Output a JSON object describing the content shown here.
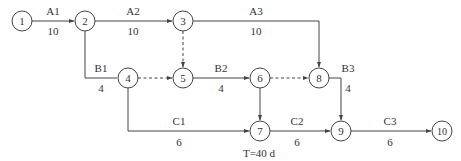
{
  "diagram": {
    "type": "activity-on-arrow network diagram",
    "nodes": [
      {
        "id": "1",
        "label": "1",
        "x": 22,
        "y": 21
      },
      {
        "id": "2",
        "label": "2",
        "x": 85,
        "y": 21
      },
      {
        "id": "3",
        "label": "3",
        "x": 183,
        "y": 21
      },
      {
        "id": "4",
        "label": "4",
        "x": 128,
        "y": 78
      },
      {
        "id": "5",
        "label": "5",
        "x": 183,
        "y": 78
      },
      {
        "id": "6",
        "label": "6",
        "x": 260,
        "y": 78
      },
      {
        "id": "7",
        "label": "7",
        "x": 260,
        "y": 131
      },
      {
        "id": "8",
        "label": "8",
        "x": 319,
        "y": 78
      },
      {
        "id": "9",
        "label": "9",
        "x": 341,
        "y": 131
      },
      {
        "id": "10",
        "label": "10",
        "x": 442,
        "y": 131
      }
    ],
    "activities": [
      {
        "name": "A1",
        "duration": "10",
        "from": "1",
        "to": "2"
      },
      {
        "name": "A2",
        "duration": "10",
        "from": "2",
        "to": "3"
      },
      {
        "name": "A3",
        "duration": "10",
        "from": "3",
        "to": "8"
      },
      {
        "name": "B1",
        "duration": "4",
        "from": "2",
        "to": "4"
      },
      {
        "name": "B2",
        "duration": "4",
        "from": "5",
        "to": "6"
      },
      {
        "name": "B3",
        "duration": "4",
        "from": "8",
        "to": "9"
      },
      {
        "name": "C1",
        "duration": "6",
        "from": "4",
        "to": "7"
      },
      {
        "name": "C2",
        "duration": "6",
        "from": "7",
        "to": "9"
      },
      {
        "name": "C3",
        "duration": "6",
        "from": "9",
        "to": "10"
      }
    ],
    "dummy_activities": [
      {
        "from": "3",
        "to": "5"
      },
      {
        "from": "4",
        "to": "5"
      },
      {
        "from": "6",
        "to": "8"
      },
      {
        "from": "6",
        "to": "7"
      }
    ],
    "annotation": "T=40 d"
  },
  "labels": {
    "A1": "A1",
    "A1_d": "10",
    "A2": "A2",
    "A2_d": "10",
    "A3": "A3",
    "A3_d": "10",
    "B1": "B1",
    "B1_d": "4",
    "B2": "B2",
    "B2_d": "4",
    "B3": "B3",
    "B3_d": "4",
    "C1": "C1",
    "C1_d": "6",
    "C2": "C2",
    "C2_d": "6",
    "C3": "C3",
    "C3_d": "6",
    "n1": "1",
    "n2": "2",
    "n3": "3",
    "n4": "4",
    "n5": "5",
    "n6": "6",
    "n7": "7",
    "n8": "8",
    "n9": "9",
    "n10": "10",
    "total": "T=40 d"
  }
}
